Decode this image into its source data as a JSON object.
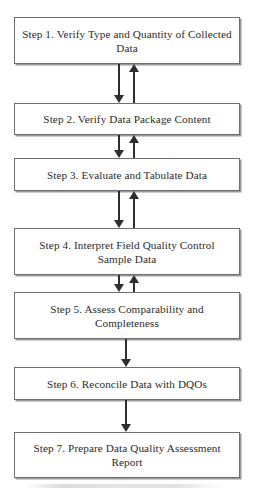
{
  "diagram": {
    "type": "flowchart",
    "orientation": "vertical",
    "colors": {
      "box_border": "#6e6e6e",
      "box_fill": "#ffffff",
      "text": "#2b2b2b",
      "arrow": "#2e2e2e",
      "page_background": "#ffffff"
    },
    "nodes": [
      {
        "id": "step1",
        "label": "Step 1. Verify Type and Quantity of Collected Data"
      },
      {
        "id": "step2",
        "label": "Step 2. Verify Data Package Content"
      },
      {
        "id": "step3",
        "label": "Step 3. Evaluate and Tabulate Data"
      },
      {
        "id": "step4",
        "label": "Step 4. Interpret Field Quality Control Sample Data"
      },
      {
        "id": "step5",
        "label": "Step 5. Assess Comparability and Completeness"
      },
      {
        "id": "step6",
        "label": "Step 6. Reconcile Data with DQOs"
      },
      {
        "id": "step7",
        "label": "Step 7. Prepare Data Quality Assessment Report"
      }
    ],
    "connectors": [
      {
        "id": "c12",
        "from": "step1",
        "to": "step2",
        "direction": "bidirectional"
      },
      {
        "id": "c23",
        "from": "step2",
        "to": "step3",
        "direction": "bidirectional"
      },
      {
        "id": "c34",
        "from": "step3",
        "to": "step4",
        "direction": "bidirectional"
      },
      {
        "id": "c45",
        "from": "step4",
        "to": "step5",
        "direction": "bidirectional"
      },
      {
        "id": "c56",
        "from": "step5",
        "to": "step6",
        "direction": "down"
      },
      {
        "id": "c67",
        "from": "step6",
        "to": "step7",
        "direction": "down"
      }
    ]
  }
}
